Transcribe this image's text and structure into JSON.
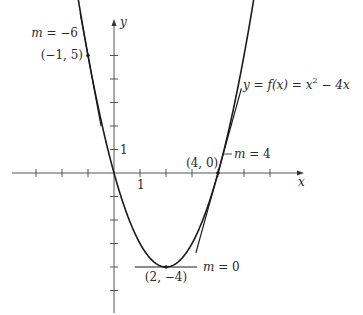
{
  "figure": {
    "function_label": {
      "prefix": "y = f(x) = x",
      "exponent": "2",
      "suffix": " − 4x"
    },
    "function": {
      "a": 1,
      "b": -4,
      "c": 0,
      "expression": "x^2 - 4x"
    },
    "axes": {
      "x_label": "x",
      "y_label": "y",
      "x_unit_label": "1",
      "y_unit_label": "1",
      "x_range": [
        -3,
        7.3
      ],
      "y_range": [
        -6,
        6.5
      ],
      "x_ticks": [
        -3,
        -2,
        -1,
        1,
        2,
        3,
        4,
        5,
        6
      ],
      "y_ticks": [
        -5,
        -4,
        -3,
        -2,
        -1,
        1,
        2,
        3,
        4,
        5
      ]
    },
    "tangents": [
      {
        "point": [
          -1,
          5
        ],
        "point_label": "(−1, 5)",
        "slope": -6,
        "slope_label": "m = −6",
        "x_span": [
          -1.3,
          -0.5
        ]
      },
      {
        "point": [
          2,
          -4
        ],
        "point_label": "(2, −4)",
        "slope": 0,
        "slope_label": "m = 0",
        "x_span": [
          0.8,
          3.2
        ]
      },
      {
        "point": [
          4,
          0
        ],
        "point_label": "(4, 0)",
        "slope": 4,
        "slope_label": "m = 4",
        "x_span": [
          3.15,
          4.9
        ]
      }
    ]
  }
}
